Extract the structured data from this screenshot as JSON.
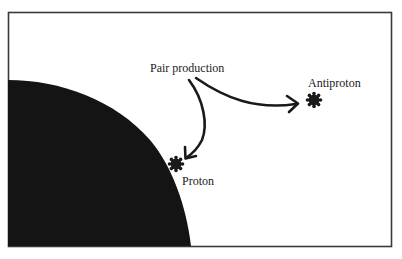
{
  "diagram": {
    "type": "physics-illustration",
    "labels": {
      "pair_production": "Pair production",
      "antiproton": "Antiproton",
      "proton": "Proton"
    },
    "elements": [
      {
        "id": "frame",
        "kind": "rectangle-border"
      },
      {
        "id": "dense-body",
        "kind": "dark-quarter-disc",
        "position": "bottom-left"
      },
      {
        "id": "arrow-to-antiproton",
        "kind": "curved-arrow",
        "from": "pair_production",
        "to": "antiproton"
      },
      {
        "id": "arrow-to-proton",
        "kind": "curved-arrow",
        "from": "pair_production",
        "to": "proton"
      },
      {
        "id": "antiproton-particle",
        "kind": "particle-blob"
      },
      {
        "id": "proton-particle",
        "kind": "particle-blob"
      }
    ],
    "colors": {
      "ink": "#1a1a1a",
      "frame": "#3a3a3a",
      "background": "#ffffff"
    }
  }
}
